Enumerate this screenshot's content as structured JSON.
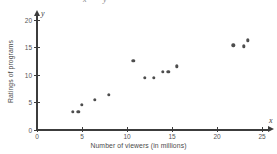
{
  "figure": {
    "top_artifact": {
      "fragment_1": "x",
      "fragment_2": "y"
    }
  },
  "chart_data": {
    "type": "scatter",
    "title": "",
    "xlabel": "Number of viewers (in millions)",
    "ylabel": "Ratings of programs",
    "x_axis_variable": "x",
    "y_axis_variable": "y",
    "xlim": [
      0,
      25
    ],
    "ylim": [
      0,
      20
    ],
    "xticks": [
      0,
      5,
      10,
      15,
      20,
      25
    ],
    "yticks": [
      0,
      5,
      10,
      15,
      20
    ],
    "xticklabels": [
      "0",
      "5",
      "10",
      "15",
      "20",
      "25"
    ],
    "yticklabels": [
      "0",
      "5",
      "10",
      "15",
      "20"
    ],
    "grid": false,
    "legend": null,
    "marker_color": "#4d4d4d",
    "axis_color": "#3c3c3c",
    "points": [
      {
        "x": 4.0,
        "y": 3.2
      },
      {
        "x": 4.6,
        "y": 3.2
      },
      {
        "x": 5.0,
        "y": 4.5
      },
      {
        "x": 6.4,
        "y": 5.4
      },
      {
        "x": 8.0,
        "y": 6.3
      },
      {
        "x": 10.7,
        "y": 12.5
      },
      {
        "x": 12.0,
        "y": 9.4
      },
      {
        "x": 13.0,
        "y": 9.4
      },
      {
        "x": 14.0,
        "y": 10.5
      },
      {
        "x": 14.6,
        "y": 10.5
      },
      {
        "x": 15.5,
        "y": 11.5
      },
      {
        "x": 21.8,
        "y": 15.3
      },
      {
        "x": 23.0,
        "y": 15.1
      },
      {
        "x": 23.4,
        "y": 16.2
      }
    ]
  }
}
